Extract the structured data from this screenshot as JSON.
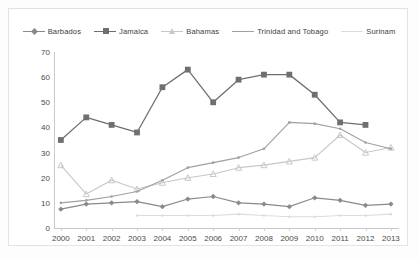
{
  "chart_data": {
    "type": "line",
    "title": "",
    "xlabel": "",
    "ylabel": "",
    "x": [
      2000,
      2001,
      2002,
      2003,
      2004,
      2005,
      2006,
      2007,
      2008,
      2009,
      2010,
      2011,
      2012,
      2013
    ],
    "xtick_labels": [
      "2000",
      "2001",
      "2002",
      "2003",
      "2004",
      "2005",
      "2006",
      "2007",
      "2008",
      "2009",
      "2010",
      "2011",
      "2012",
      "2013"
    ],
    "ytick_labels": [
      "0",
      "10",
      "20",
      "30",
      "40",
      "50",
      "60",
      "70"
    ],
    "yticks": [
      0,
      10,
      20,
      30,
      40,
      50,
      60,
      70
    ],
    "ylim": [
      0,
      70
    ],
    "grid": false,
    "legend_position": "top-center",
    "series": [
      {
        "name": "Barbados",
        "color": "#8a8a8a",
        "marker": "diamond",
        "values": [
          7.5,
          9.5,
          10.0,
          10.5,
          8.5,
          11.5,
          12.5,
          10.0,
          9.5,
          8.5,
          12.0,
          11.0,
          9.0,
          9.5
        ]
      },
      {
        "name": "Jamaica",
        "color": "#6f6f6f",
        "marker": "square",
        "values": [
          35.0,
          44.0,
          41.0,
          38.0,
          56.0,
          63.0,
          50.0,
          59.0,
          61.0,
          61.0,
          53.0,
          42.0,
          41.0,
          null
        ]
      },
      {
        "name": "Bahamas",
        "color": "#c7c7c7",
        "marker": "triangle",
        "values": [
          25.0,
          13.5,
          19.0,
          15.5,
          18.0,
          20.0,
          21.5,
          24.0,
          25.0,
          26.5,
          28.0,
          37.0,
          30.0,
          32.0
        ]
      },
      {
        "name": "Trinidad and Tobago",
        "color": "#a0a0a0",
        "marker": "none",
        "values": [
          10.0,
          11.0,
          12.5,
          14.5,
          19.0,
          24.0,
          26.0,
          28.0,
          31.5,
          42.0,
          41.5,
          39.5,
          34.0,
          31.5
        ]
      },
      {
        "name": "Surinam",
        "color": "#dcdcdc",
        "marker": "none",
        "values": [
          null,
          null,
          null,
          5.0,
          5.0,
          5.0,
          5.0,
          5.5,
          5.0,
          4.5,
          4.5,
          5.0,
          5.0,
          5.5
        ]
      }
    ]
  },
  "legend": {
    "items": [
      {
        "label": "Barbados"
      },
      {
        "label": "Jamaica"
      },
      {
        "label": "Bahamas"
      },
      {
        "label": "Trinidad and Tobago"
      },
      {
        "label": "Surinam"
      }
    ]
  }
}
